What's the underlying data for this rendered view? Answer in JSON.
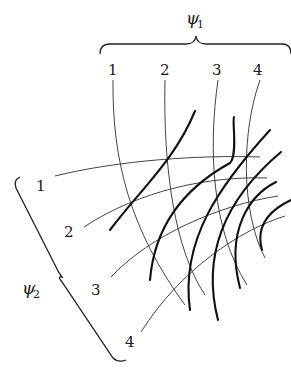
{
  "diagram": {
    "top_group": {
      "symbol": "ψ",
      "subscript": "1",
      "labels": [
        "1",
        "2",
        "3",
        "4"
      ]
    },
    "left_group": {
      "symbol": "ψ",
      "subscript": "2",
      "labels": [
        "1",
        "2",
        "3",
        "4"
      ]
    }
  }
}
